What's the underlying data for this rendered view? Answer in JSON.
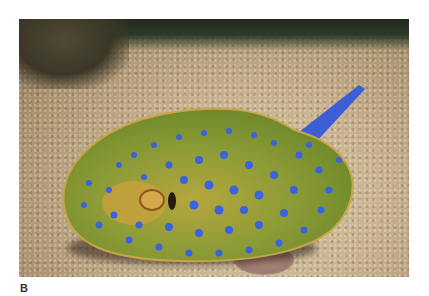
{
  "figure": {
    "label": "B",
    "photo": {
      "subject": "blue-spotted stingray on sandy seabed",
      "colors": {
        "body": "#8fa03a",
        "body_edge": "#c6a24a",
        "spots": "#3b62e0",
        "tail": "#3c5fd8",
        "sand": "#d2bf9c",
        "background_top": "#2a3424"
      }
    }
  }
}
